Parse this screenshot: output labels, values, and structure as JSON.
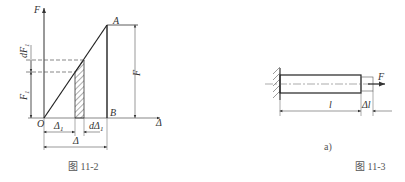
{
  "figure_left": {
    "caption": "图   11-2",
    "axis_y_label": "F",
    "axis_x_label": "Δ",
    "origin_label": "O",
    "point_a_label": "A",
    "point_b_label": "B",
    "force_label": "F",
    "f1_label": "F",
    "f1_sub": "1",
    "df1_label": "dF",
    "df1_sub": "1",
    "delta1_label": "Δ",
    "delta1_sub": "1",
    "ddelta1_label": "dΔ",
    "ddelta1_sub": "1",
    "delta_total_label": "Δ"
  },
  "figure_right": {
    "subfigure_label": "a)",
    "caption": "图   11-3",
    "force_label": "F",
    "length_label": "l",
    "elongation_label": "Δl"
  }
}
